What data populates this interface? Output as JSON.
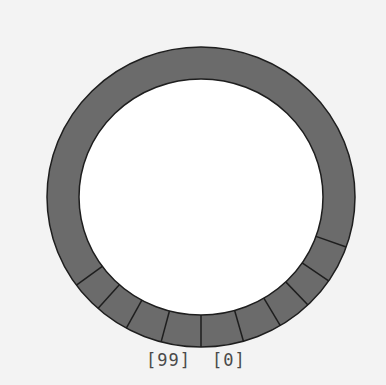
{
  "diagram": {
    "type": "circular-buffer",
    "colors": {
      "background": "#f3f3f3",
      "ring_fill": "#6b6b6b",
      "ring_stroke": "#1e1e1e",
      "inner_fill": "#ffffff",
      "label_text": "#4a4a4a"
    },
    "geometry": {
      "cx": 201,
      "cy": 197,
      "outer_rx": 154,
      "outer_ry": 150,
      "inner_rx": 122,
      "inner_ry": 118
    },
    "divider_angles_deg": [
      19.5,
      34,
      46,
      59,
      74,
      90,
      105,
      119,
      132,
      144
    ],
    "labels": {
      "last_index": "[99]",
      "first_index": "[0]"
    }
  }
}
